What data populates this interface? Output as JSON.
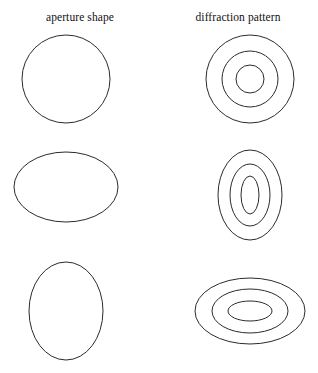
{
  "figure": {
    "background_color": "#ffffff",
    "stroke_color": "#2b2b2b",
    "columns": [
      {
        "id": "aperture",
        "label": "aperture shape"
      },
      {
        "id": "diffraction",
        "label": "diffraction pattern"
      }
    ],
    "rows": [
      {
        "id": "row-circular",
        "aperture": {
          "shape": "circle",
          "cx": 66,
          "cy": 79,
          "rx": 44,
          "ry": 44
        },
        "pattern": {
          "shape": "concentric-circles",
          "cx": 250,
          "cy": 79,
          "rings": [
            {
              "rx": 44,
              "ry": 44
            },
            {
              "rx": 28,
              "ry": 28
            },
            {
              "rx": 14,
              "ry": 14
            }
          ]
        }
      },
      {
        "id": "row-wide-aperture",
        "aperture": {
          "shape": "ellipse-wide",
          "cx": 66,
          "cy": 187,
          "rx": 52,
          "ry": 35
        },
        "pattern": {
          "shape": "concentric-ellipses-tall",
          "cx": 250,
          "cy": 195,
          "rings": [
            {
              "rx": 32,
              "ry": 45
            },
            {
              "rx": 20,
              "ry": 31
            },
            {
              "rx": 9,
              "ry": 19
            }
          ]
        }
      },
      {
        "id": "row-tall-aperture",
        "aperture": {
          "shape": "ellipse-tall",
          "cx": 66,
          "cy": 311,
          "rx": 37,
          "ry": 49
        },
        "pattern": {
          "shape": "concentric-ellipses-wide",
          "cx": 250,
          "cy": 311,
          "rings": [
            {
              "rx": 55,
              "ry": 33
            },
            {
              "rx": 38,
              "ry": 22
            },
            {
              "rx": 22,
              "ry": 10
            }
          ]
        }
      }
    ]
  }
}
